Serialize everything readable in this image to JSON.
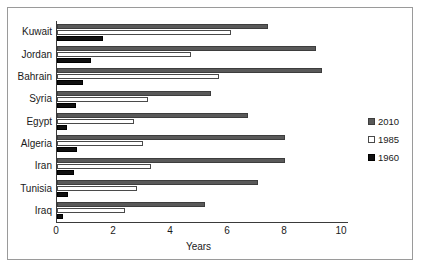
{
  "chart_data": {
    "type": "bar",
    "orientation": "horizontal",
    "title": "",
    "xlabel": "Years",
    "ylabel": "",
    "xlim": [
      0,
      10
    ],
    "xticks": [
      0,
      2,
      4,
      6,
      8,
      10
    ],
    "xtick_labels": [
      "0",
      "2",
      "4",
      "6",
      "8",
      "10"
    ],
    "grid": false,
    "legend_position": "right",
    "categories": [
      "Kuwait",
      "Jordan",
      "Bahrain",
      "Syria",
      "Egypt",
      "Algeria",
      "Iran",
      "Tunisia",
      "Iraq"
    ],
    "series": [
      {
        "name": "2010",
        "color": "#595959",
        "values": [
          7.4,
          9.1,
          9.3,
          5.4,
          6.7,
          8.0,
          8.0,
          7.05,
          5.2
        ]
      },
      {
        "name": "1985",
        "color": "#ffffff",
        "values": [
          6.1,
          4.7,
          5.7,
          3.2,
          2.7,
          3.0,
          3.3,
          2.8,
          2.4
        ]
      },
      {
        "name": "1960",
        "color": "#101010",
        "values": [
          1.6,
          1.2,
          0.9,
          0.65,
          0.35,
          0.7,
          0.6,
          0.4,
          0.2
        ]
      }
    ]
  },
  "legend": {
    "entries": [
      {
        "label": "2010",
        "swatch": "filled-gray"
      },
      {
        "label": "1985",
        "swatch": "hollow-white"
      },
      {
        "label": "1960",
        "swatch": "filled-black"
      }
    ]
  }
}
